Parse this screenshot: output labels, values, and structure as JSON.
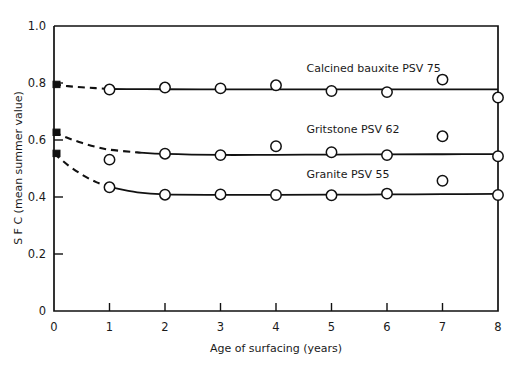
{
  "chart_data": {
    "type": "line",
    "title": "",
    "xlabel": "Age of surfacing (years)",
    "ylabel": "S F C  (mean summer value)",
    "xlim": [
      0,
      8
    ],
    "ylim": [
      0,
      1.0
    ],
    "xticks": [
      0,
      1,
      2,
      3,
      4,
      5,
      6,
      7,
      8
    ],
    "xtick_labels": [
      "0",
      "1",
      "2",
      "3",
      "4",
      "5",
      "6",
      "7",
      "8"
    ],
    "yticks": [
      0,
      0.2,
      0.4,
      0.6,
      0.8,
      1.0
    ],
    "ytick_labels": [
      "0",
      "0.2",
      "0.4",
      "0.6",
      "0.8",
      "1.0"
    ],
    "grid": false,
    "legend_position": "inline-annotations",
    "series": [
      {
        "name": "Calcined bauxite PSV 75",
        "label": "Calcined bauxite PSV 75",
        "label_x": 4.55,
        "label_y": 0.838,
        "fitted_x": [
          0,
          0.25,
          0.5,
          0.75,
          1,
          1.5,
          2,
          3,
          4,
          5,
          6,
          7,
          8
        ],
        "fitted_y": [
          0.795,
          0.789,
          0.785,
          0.782,
          0.779,
          0.7785,
          0.778,
          0.7775,
          0.7775,
          0.7775,
          0.7775,
          0.7775,
          0.7775
        ],
        "dashed_until_x": 1,
        "points_x": [
          1,
          2,
          3,
          4,
          5,
          6,
          7,
          8
        ],
        "points_y": [
          0.777,
          0.784,
          0.781,
          0.792,
          0.772,
          0.768,
          0.812,
          0.749
        ]
      },
      {
        "name": "Gritstone PSV 62",
        "label": "Gritstone PSV 62",
        "label_x": 4.55,
        "label_y": 0.625,
        "fitted_x": [
          0,
          0.25,
          0.5,
          0.75,
          1,
          1.5,
          2,
          3,
          4,
          5,
          6,
          7,
          8
        ],
        "fitted_y": [
          0.627,
          0.607,
          0.59,
          0.576,
          0.566,
          0.5565,
          0.551,
          0.5475,
          0.548,
          0.549,
          0.5495,
          0.55,
          0.5505
        ],
        "dashed_until_x": 1.55,
        "points_x": [
          1,
          2,
          3,
          4,
          5,
          6,
          7,
          8
        ],
        "points_y": [
          0.531,
          0.552,
          0.547,
          0.578,
          0.557,
          0.547,
          0.613,
          0.543
        ]
      },
      {
        "name": "Granite PSV 55",
        "label": "Granite PSV 55",
        "label_x": 4.55,
        "label_y": 0.467,
        "fitted_x": [
          0,
          0.25,
          0.5,
          0.75,
          1,
          1.5,
          2,
          3,
          4,
          5,
          6,
          7,
          8
        ],
        "fitted_y": [
          0.553,
          0.512,
          0.479,
          0.453,
          0.435,
          0.4165,
          0.409,
          0.4075,
          0.4075,
          0.408,
          0.409,
          0.41,
          0.411
        ],
        "dashed_until_x": 1,
        "points_x": [
          1,
          2,
          3,
          4,
          5,
          6,
          7,
          8
        ],
        "points_y": [
          0.434,
          0.408,
          0.409,
          0.407,
          0.406,
          0.412,
          0.457,
          0.407
        ]
      }
    ]
  }
}
